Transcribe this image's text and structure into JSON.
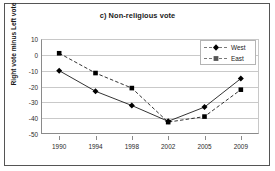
{
  "chart_data": {
    "type": "line",
    "title": "c) Non-religious vote",
    "xlabel": "",
    "ylabel": "Right vote minus Left vote",
    "categories": [
      "1990",
      "1994",
      "1998",
      "2002",
      "2005",
      "2009"
    ],
    "series": [
      {
        "name": "West",
        "marker": "diamond",
        "linestyle": "solid",
        "color": "#000000",
        "values": [
          -10,
          -23,
          -32,
          -42,
          -33,
          -15
        ]
      },
      {
        "name": "East",
        "marker": "square",
        "linestyle": "dashed",
        "color": "#000000",
        "values": [
          1,
          -11.5,
          -21,
          -42.5,
          -39,
          -22
        ]
      }
    ],
    "ylim": [
      -50,
      10
    ],
    "yticks": [
      10,
      0,
      -10,
      -20,
      -30,
      -40,
      -50
    ],
    "ytick_labels": [
      "10",
      "0",
      "-10",
      "-20",
      "-30",
      "-40",
      "-50"
    ],
    "grid": true,
    "grid_axis": "y",
    "legend_position": "top-right",
    "legend_entries": [
      "West",
      "East"
    ]
  },
  "icons": {
    "west_marker": "filled-diamond-marker-icon",
    "east_marker": "filled-square-marker-icon"
  }
}
